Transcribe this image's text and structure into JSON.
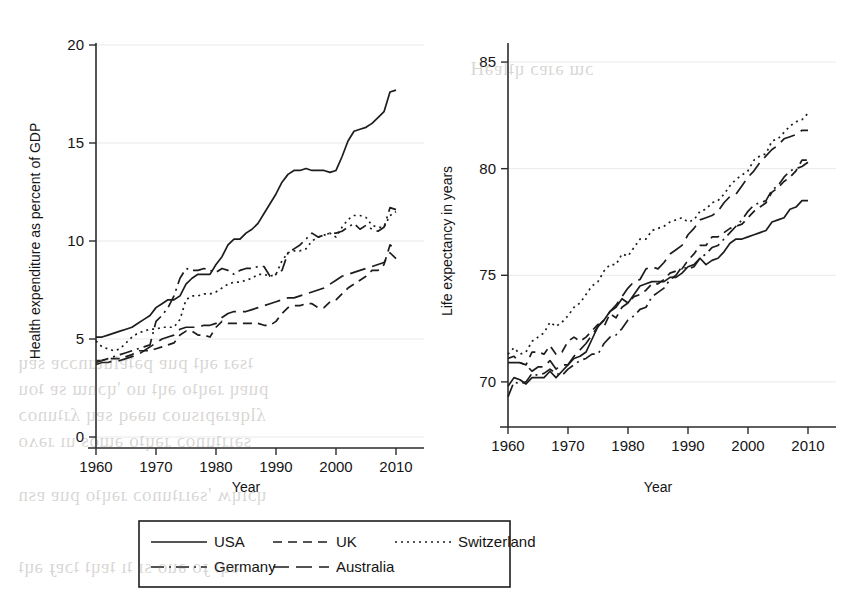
{
  "figure": {
    "background_color": "#ffffff",
    "line_color": "#1d1d1d",
    "grid_color": "#e9e9e9"
  },
  "legend": {
    "entries": [
      {
        "label": "USA",
        "dash": "solid",
        "dasharray": ""
      },
      {
        "label": "UK",
        "dash": "dashed",
        "dasharray": "9,6"
      },
      {
        "label": "Switzerland",
        "dash": "dotted",
        "dasharray": "2,4"
      },
      {
        "label": "Germany",
        "dash": "dash-dot",
        "dasharray": "13,5,2,5"
      },
      {
        "label": "Australia",
        "dash": "long-dash",
        "dasharray": "16,7"
      }
    ]
  },
  "chart_data": [
    {
      "id": "health-expenditure",
      "type": "line",
      "title": "",
      "xlabel": "Year",
      "ylabel": "Health expenditure as percent of GDP",
      "xlim": [
        1960,
        2010
      ],
      "ylim": [
        0,
        20
      ],
      "xticks": [
        1960,
        1970,
        1980,
        1990,
        2000,
        2010
      ],
      "yticks": [
        0,
        5,
        10,
        15,
        20
      ],
      "grid": "horizontal",
      "legend_position": "below-figure",
      "x": [
        1960,
        1961,
        1962,
        1963,
        1964,
        1965,
        1966,
        1967,
        1968,
        1969,
        1970,
        1971,
        1972,
        1973,
        1974,
        1975,
        1976,
        1977,
        1978,
        1979,
        1980,
        1981,
        1982,
        1983,
        1984,
        1985,
        1986,
        1987,
        1988,
        1989,
        1990,
        1991,
        1992,
        1993,
        1994,
        1995,
        1996,
        1997,
        1998,
        1999,
        2000,
        2001,
        2002,
        2003,
        2004,
        2005,
        2006,
        2007,
        2008,
        2009,
        2010
      ],
      "series": [
        {
          "name": "USA",
          "dash": "solid",
          "values": [
            5.1,
            5.1,
            5.2,
            5.3,
            5.4,
            5.5,
            5.6,
            5.8,
            6.0,
            6.2,
            6.6,
            6.8,
            7.0,
            7.0,
            7.2,
            7.8,
            8.1,
            8.3,
            8.3,
            8.3,
            8.8,
            9.2,
            9.8,
            10.1,
            10.1,
            10.4,
            10.6,
            10.9,
            11.4,
            11.9,
            12.4,
            13.0,
            13.4,
            13.6,
            13.6,
            13.7,
            13.6,
            13.6,
            13.6,
            13.5,
            13.6,
            14.3,
            15.1,
            15.6,
            15.7,
            15.8,
            16.0,
            16.3,
            16.6,
            17.6,
            17.7
          ]
        },
        {
          "name": "UK",
          "dash": "dashed",
          "values": [
            3.9,
            3.9,
            4.0,
            4.0,
            4.0,
            4.1,
            4.2,
            4.4,
            4.4,
            4.4,
            4.5,
            4.6,
            4.7,
            4.8,
            5.2,
            5.4,
            5.4,
            5.2,
            5.2,
            5.1,
            5.6,
            5.9,
            5.8,
            5.8,
            5.8,
            5.8,
            5.8,
            5.8,
            5.7,
            5.7,
            5.9,
            6.3,
            6.6,
            6.7,
            6.7,
            6.8,
            6.8,
            6.6,
            6.6,
            6.9,
            7.0,
            7.3,
            7.6,
            7.8,
            8.0,
            8.2,
            8.5,
            8.5,
            8.8,
            9.8,
            9.6
          ]
        },
        {
          "name": "Switzerland",
          "dash": "dotted",
          "values": [
            4.9,
            4.6,
            4.5,
            4.4,
            4.5,
            4.8,
            5.1,
            5.3,
            5.4,
            5.5,
            5.5,
            5.6,
            5.6,
            5.6,
            6.0,
            7.0,
            7.2,
            7.2,
            7.3,
            7.3,
            7.4,
            7.6,
            7.8,
            7.9,
            7.9,
            8.0,
            8.1,
            8.3,
            8.3,
            8.2,
            8.3,
            9.0,
            9.4,
            9.5,
            9.5,
            9.6,
            10.0,
            10.2,
            10.3,
            10.4,
            10.2,
            10.7,
            11.1,
            11.3,
            11.3,
            11.2,
            10.8,
            10.7,
            10.7,
            11.3,
            11.5
          ]
        },
        {
          "name": "Germany",
          "dash": "dash-dot",
          "values": [
            3.8,
            3.9,
            4.0,
            4.1,
            4.2,
            4.3,
            4.4,
            4.5,
            4.6,
            4.7,
            5.9,
            6.2,
            6.6,
            7.2,
            8.1,
            8.6,
            8.5,
            8.5,
            8.6,
            8.5,
            8.4,
            8.6,
            8.5,
            8.3,
            8.5,
            8.6,
            8.6,
            8.7,
            8.7,
            8.2,
            8.3,
            8.5,
            9.4,
            9.6,
            9.8,
            10.1,
            10.4,
            10.2,
            10.3,
            10.4,
            10.4,
            10.5,
            10.7,
            10.9,
            10.6,
            10.8,
            10.6,
            10.5,
            10.7,
            11.7,
            11.6
          ]
        },
        {
          "name": "Australia",
          "dash": "long-dash",
          "values": [
            3.7,
            3.8,
            3.8,
            3.9,
            3.9,
            4.0,
            4.1,
            4.2,
            4.4,
            4.6,
            4.8,
            5.0,
            5.1,
            5.2,
            5.5,
            5.6,
            5.6,
            5.6,
            5.7,
            5.7,
            5.8,
            6.1,
            6.3,
            6.4,
            6.4,
            6.4,
            6.5,
            6.6,
            6.7,
            6.8,
            6.9,
            7.0,
            7.1,
            7.1,
            7.2,
            7.3,
            7.4,
            7.5,
            7.6,
            7.8,
            8.0,
            8.2,
            8.3,
            8.4,
            8.5,
            8.6,
            8.7,
            8.8,
            8.9,
            9.4,
            9.1
          ]
        }
      ]
    },
    {
      "id": "life-expectancy",
      "type": "line",
      "title": "",
      "xlabel": "Year",
      "ylabel": "Life expectancy in years",
      "xlim": [
        1960,
        2010
      ],
      "ylim": [
        68.4,
        85.8
      ],
      "xticks": [
        1960,
        1970,
        1980,
        1990,
        2000,
        2010
      ],
      "yticks": [
        70,
        75,
        80,
        85
      ],
      "grid": "horizontal",
      "legend_position": "below-figure",
      "x": [
        1960,
        1961,
        1962,
        1963,
        1964,
        1965,
        1966,
        1967,
        1968,
        1969,
        1970,
        1971,
        1972,
        1973,
        1974,
        1975,
        1976,
        1977,
        1978,
        1979,
        1980,
        1981,
        1982,
        1983,
        1984,
        1985,
        1986,
        1987,
        1988,
        1989,
        1990,
        1991,
        1992,
        1993,
        1994,
        1995,
        1996,
        1997,
        1998,
        1999,
        2000,
        2001,
        2002,
        2003,
        2004,
        2005,
        2006,
        2007,
        2008,
        2009,
        2010
      ],
      "series": [
        {
          "name": "USA",
          "dash": "solid",
          "values": [
            69.8,
            70.2,
            70.1,
            69.9,
            70.2,
            70.2,
            70.2,
            70.5,
            70.2,
            70.5,
            70.8,
            71.1,
            71.2,
            71.4,
            72.0,
            72.6,
            72.9,
            73.3,
            73.5,
            73.9,
            73.7,
            74.1,
            74.5,
            74.6,
            74.7,
            74.7,
            74.7,
            74.9,
            74.9,
            75.1,
            75.4,
            75.5,
            75.8,
            75.5,
            75.7,
            75.8,
            76.1,
            76.5,
            76.7,
            76.7,
            76.8,
            76.9,
            77.0,
            77.1,
            77.5,
            77.6,
            77.7,
            78.1,
            78.2,
            78.5,
            78.5
          ]
        },
        {
          "name": "UK",
          "dash": "dashed",
          "values": [
            71.1,
            71.2,
            70.9,
            70.8,
            71.4,
            71.4,
            71.3,
            71.7,
            71.3,
            71.4,
            71.9,
            72.1,
            71.9,
            72.1,
            72.4,
            72.7,
            72.6,
            73.2,
            73.0,
            73.5,
            73.7,
            74.0,
            74.1,
            74.3,
            74.6,
            74.6,
            74.8,
            75.1,
            75.2,
            75.3,
            75.7,
            76.0,
            76.4,
            76.4,
            76.8,
            76.8,
            77.0,
            77.2,
            77.3,
            77.4,
            77.7,
            78.0,
            78.2,
            78.4,
            78.9,
            79.1,
            79.4,
            79.6,
            79.9,
            80.4,
            80.4
          ]
        },
        {
          "name": "Switzerland",
          "dash": "dotted",
          "values": [
            71.3,
            71.6,
            71.3,
            71.4,
            71.9,
            72.1,
            72.3,
            72.8,
            72.6,
            72.8,
            73.1,
            73.5,
            73.7,
            74.1,
            74.5,
            74.7,
            75.2,
            75.5,
            75.5,
            76.0,
            75.9,
            76.3,
            76.7,
            76.7,
            77.1,
            77.2,
            77.3,
            77.5,
            77.6,
            77.7,
            77.5,
            77.6,
            78.0,
            78.1,
            78.4,
            78.5,
            78.8,
            79.2,
            79.5,
            79.7,
            79.9,
            80.4,
            80.6,
            80.7,
            81.3,
            81.4,
            81.7,
            82.0,
            82.2,
            82.3,
            82.6
          ]
        },
        {
          "name": "Germany",
          "dash": "dash-dot",
          "values": [
            69.3,
            70.0,
            69.9,
            70.0,
            70.4,
            70.3,
            70.4,
            70.6,
            70.4,
            70.3,
            70.6,
            70.8,
            71.0,
            71.1,
            71.3,
            71.3,
            71.8,
            72.1,
            72.2,
            72.5,
            72.9,
            73.1,
            73.4,
            73.5,
            74.0,
            74.2,
            74.4,
            74.8,
            75.0,
            75.4,
            75.3,
            75.4,
            75.8,
            76.0,
            76.3,
            76.4,
            76.7,
            77.0,
            77.3,
            77.6,
            78.0,
            78.3,
            78.4,
            78.5,
            79.0,
            79.2,
            79.6,
            79.9,
            80.0,
            80.1,
            80.3
          ]
        },
        {
          "name": "Australia",
          "dash": "long-dash",
          "values": [
            70.9,
            70.9,
            70.9,
            70.8,
            70.5,
            70.7,
            70.7,
            71.0,
            70.6,
            70.8,
            70.8,
            71.2,
            71.5,
            71.8,
            72.2,
            72.6,
            72.9,
            73.3,
            73.6,
            74.0,
            74.4,
            74.7,
            74.8,
            75.3,
            75.4,
            75.3,
            75.6,
            76.0,
            76.2,
            76.4,
            76.9,
            77.2,
            77.6,
            77.7,
            77.8,
            78.0,
            78.4,
            78.7,
            78.8,
            79.2,
            79.6,
            79.9,
            80.3,
            80.6,
            80.9,
            81.1,
            81.4,
            81.5,
            81.6,
            81.8,
            81.8
          ]
        }
      ]
    }
  ]
}
